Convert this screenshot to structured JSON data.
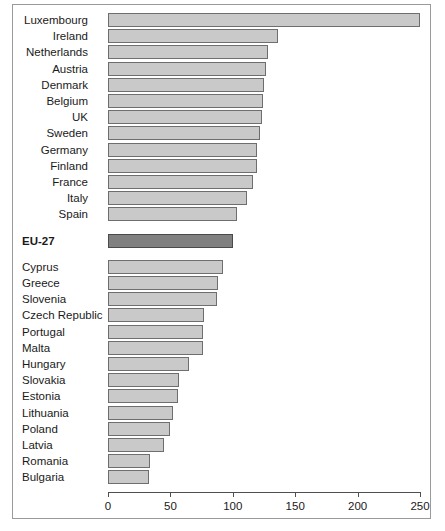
{
  "chart_data": {
    "type": "bar",
    "orientation": "horizontal",
    "title": "",
    "subtitle": "",
    "xlabel": "",
    "ylabel": "",
    "xlim": [
      0,
      250
    ],
    "xticks": [
      0,
      50,
      100,
      150,
      200,
      250
    ],
    "xtick_labels": [
      "0",
      "50",
      "100",
      "150",
      "200",
      "250"
    ],
    "grid": false,
    "legend": null,
    "bar_fill_color": "#c9c9c9",
    "bar_edge_color": "#6e6e6e",
    "highlight_fill_color": "#808080",
    "highlight_edge_color": "#4a4a4a",
    "groups": [
      {
        "name": "above-average",
        "label_align": "right",
        "categories": [
          "Luxembourg",
          "Ireland",
          "Netherlands",
          "Austria",
          "Denmark",
          "Belgium",
          "UK",
          "Sweden",
          "Germany",
          "Finland",
          "France",
          "Italy",
          "Spain"
        ],
        "values": [
          250,
          136,
          128,
          127,
          125,
          124,
          123,
          122,
          119,
          119,
          116,
          111,
          103
        ]
      },
      {
        "name": "reference",
        "label_align": "left",
        "bold": true,
        "categories": [
          "EU-27"
        ],
        "values": [
          100
        ]
      },
      {
        "name": "below-average",
        "label_align": "left",
        "categories": [
          "Cyprus",
          "Greece",
          "Slovenia",
          "Czech Republic",
          "Portugal",
          "Malta",
          "Hungary",
          "Slovakia",
          "Estonia",
          "Lithuania",
          "Poland",
          "Latvia",
          "Romania",
          "Bulgaria"
        ],
        "values": [
          92,
          88,
          87,
          77,
          76,
          76,
          65,
          57,
          56,
          52,
          50,
          45,
          34,
          33
        ]
      }
    ],
    "categories": [
      "Luxembourg",
      "Ireland",
      "Netherlands",
      "Austria",
      "Denmark",
      "Belgium",
      "UK",
      "Sweden",
      "Germany",
      "Finland",
      "France",
      "Italy",
      "Spain",
      "EU-27",
      "Cyprus",
      "Greece",
      "Slovenia",
      "Czech Republic",
      "Portugal",
      "Malta",
      "Hungary",
      "Slovakia",
      "Estonia",
      "Lithuania",
      "Poland",
      "Latvia",
      "Romania",
      "Bulgaria"
    ],
    "values": [
      250,
      136,
      128,
      127,
      125,
      124,
      123,
      122,
      119,
      119,
      116,
      111,
      103,
      100,
      92,
      88,
      87,
      77,
      76,
      76,
      65,
      57,
      56,
      52,
      50,
      45,
      34,
      33
    ]
  }
}
